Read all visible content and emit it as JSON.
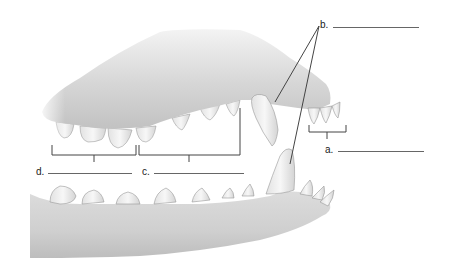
{
  "diagram": {
    "labels": [
      {
        "id": "a",
        "text": "a.",
        "answer": "",
        "points_to": "incisors (upper)"
      },
      {
        "id": "b",
        "text": "b.",
        "answer": "",
        "points_to": "canines (upper and lower)"
      },
      {
        "id": "c",
        "text": "c.",
        "answer": "",
        "points_to": "premolars"
      },
      {
        "id": "d",
        "text": "d.",
        "answer": "",
        "points_to": "molars"
      }
    ]
  },
  "colors": {
    "bone": "#d9d9d9",
    "bone_shadow": "#a8a8a8",
    "tooth": "#eeeeee",
    "line": "#444444"
  }
}
